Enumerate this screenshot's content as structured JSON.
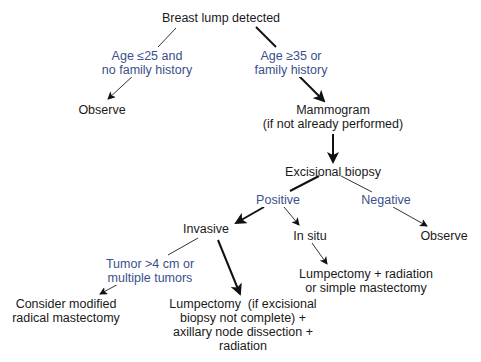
{
  "diagram": {
    "colors": {
      "node_text": "#1a1a1a",
      "condition_text": "#3b4f8c",
      "edge": "#111111",
      "background": "#ffffff"
    },
    "nodes": {
      "breast_lump": "Breast lump detected",
      "observe_young": "Observe",
      "mammogram": "Mammogram\n(if not already performed)",
      "excisional_biopsy": "Excisional biopsy",
      "invasive": "Invasive",
      "in_situ": "In situ",
      "observe_negative": "Observe",
      "modified_radical": "Consider modified\nradical mastectomy",
      "lumpectomy_invasive": "Lumpectomy  (if excisional\nbiopsy not complete) +\naxillary node dissection +\nradiation",
      "lumpectomy_in_situ": "Lumpectomy + radiation\nor simple mastectomy"
    },
    "conditions": {
      "age_young": "Age ≤25 and\nno family history",
      "age_older": "Age ≥35 or\nfamily history",
      "positive": "Positive",
      "negative": "Negative",
      "large_tumor": "Tumor >4 cm or\nmultiple tumors"
    },
    "edges": [
      {
        "from": "breast_lump",
        "to": "observe_young",
        "label": "age_young",
        "weight": "thin"
      },
      {
        "from": "breast_lump",
        "to": "mammogram",
        "label": "age_older",
        "weight": "thick"
      },
      {
        "from": "mammogram",
        "to": "excisional_biopsy",
        "label": "",
        "weight": "thick"
      },
      {
        "from": "excisional_biopsy",
        "to": "invasive",
        "label": "positive",
        "weight": "thick"
      },
      {
        "from": "excisional_biopsy",
        "to": "in_situ",
        "label": "positive",
        "weight": "thin"
      },
      {
        "from": "excisional_biopsy",
        "to": "observe_negative",
        "label": "negative",
        "weight": "thin"
      },
      {
        "from": "invasive",
        "to": "modified_radical",
        "label": "large_tumor",
        "weight": "thin"
      },
      {
        "from": "invasive",
        "to": "lumpectomy_invasive",
        "label": "",
        "weight": "thick"
      },
      {
        "from": "in_situ",
        "to": "lumpectomy_in_situ",
        "label": "",
        "weight": "thin"
      }
    ]
  }
}
